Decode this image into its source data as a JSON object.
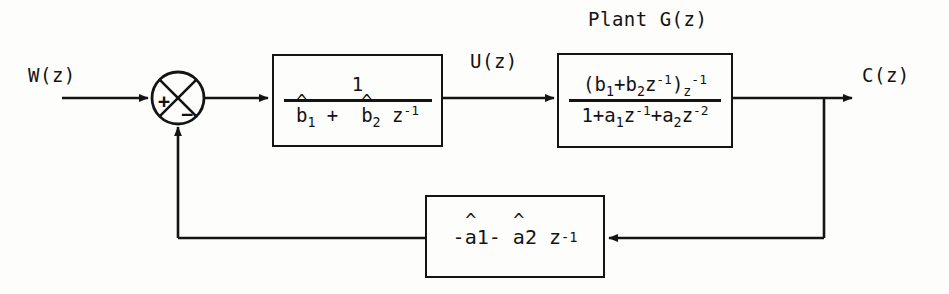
{
  "figure": {
    "type": "control-block-diagram",
    "background_color": "#fdfdfc",
    "line_color": "#141414"
  },
  "signals": {
    "input_label": "W(z)",
    "controller_output_label": "U(z)",
    "output_label": "C(z)"
  },
  "annotations": {
    "plant_caption": "Plant G(z)"
  },
  "summing_junction": {
    "name": "summing-junction",
    "shape": "circle-with-x",
    "plus_sign": "+",
    "minus_sign": "−",
    "plus_port": "left",
    "minus_port": "bottom"
  },
  "blocks": [
    {
      "id": "controller",
      "name": "controller-block",
      "kind": "fraction",
      "numerator": "1",
      "denominator_parts": [
        {
          "base": "b",
          "hat": true,
          "sub": "1"
        },
        {
          "op": "+"
        },
        {
          "base": "b",
          "hat": true,
          "sub": "2"
        },
        {
          "base": "z",
          "sup": "-1"
        }
      ],
      "denominator_text": "b̂1 + b̂2 z⁻¹"
    },
    {
      "id": "plant",
      "name": "plant-block",
      "kind": "fraction",
      "caption": "Plant G(z)",
      "numerator_text": "(b₁+b₂z⁻¹) z⁻¹",
      "denominator_text": "1+a₁z⁻¹+a₂z⁻²"
    },
    {
      "id": "feedback",
      "name": "feedback-block",
      "kind": "expression",
      "expression_text": "-â1- â2 z⁻¹"
    }
  ]
}
